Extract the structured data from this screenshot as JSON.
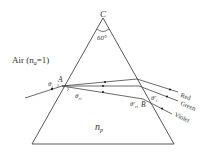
{
  "diagram": {
    "type": "prism-dispersion",
    "apex_label": "C",
    "apex_angle": "60°",
    "medium_label": "Air (n",
    "medium_sub": "a",
    "medium_eq": "=1)",
    "prism_label": "n",
    "prism_sub": "p",
    "entry_point": "A",
    "exit_point": "B",
    "incident_angle": "θ",
    "incident_sub": "i",
    "refracted_angle": "θ",
    "refracted_sub": "ri",
    "internal_exit_angle": "θ'",
    "internal_exit_sub": "ri",
    "exit_angle": "θ'",
    "exit_sub": "i",
    "rays": [
      {
        "label": "Red",
        "color": "#333333"
      },
      {
        "label": "Green",
        "color": "#333333"
      },
      {
        "label": "Violet",
        "color": "#333333"
      }
    ],
    "line_color": "#444444"
  }
}
